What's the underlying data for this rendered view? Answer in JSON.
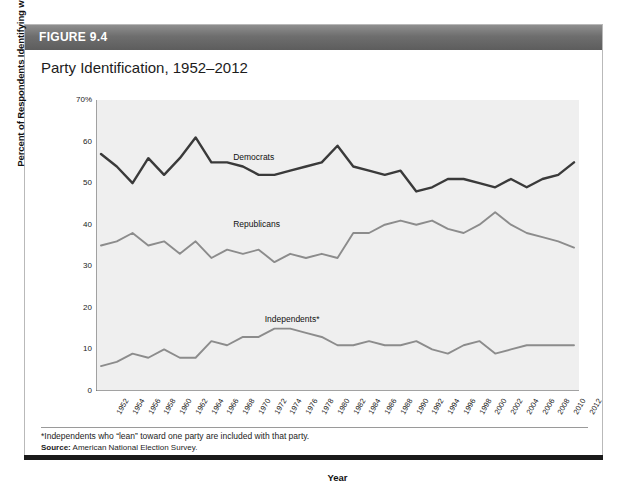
{
  "figure": {
    "header_label": "FIGURE 9.4",
    "title": "Party Identification, 1952–2012",
    "footnote": "*Independents who “lean” toward one party are included with that party.",
    "source_label": "Source:",
    "source_text": "American National Election Survey."
  },
  "colors": {
    "header_bar": "#6e6e6e",
    "plot_background": "#efefef",
    "democrats": "#3a3a3a",
    "republicans": "#8c8c8c",
    "independents": "#8c8c8c",
    "axis": "#555555",
    "bottom_rule": "#1a1a1a"
  },
  "chart_data": {
    "type": "line",
    "title": "Party Identification, 1952–2012",
    "xlabel": "Year",
    "ylabel": "Percent of Respondents Identifying with Party",
    "ylim": [
      0,
      70
    ],
    "yticks": [
      0,
      10,
      20,
      30,
      40,
      50,
      60,
      70
    ],
    "ytick_labels": [
      "0",
      "10",
      "20",
      "30",
      "40",
      "50",
      "60",
      "70%"
    ],
    "grid": false,
    "legend_position": "inline-labels",
    "x": [
      1952,
      1954,
      1956,
      1958,
      1960,
      1962,
      1964,
      1966,
      1968,
      1970,
      1972,
      1974,
      1976,
      1978,
      1980,
      1982,
      1984,
      1986,
      1988,
      1990,
      1992,
      1994,
      1996,
      1998,
      2000,
      2002,
      2004,
      2006,
      2008,
      2010,
      2012
    ],
    "xtick_labels": [
      "1952",
      "1954",
      "1956",
      "1958",
      "1960",
      "1962",
      "1964",
      "1966",
      "1968",
      "1970",
      "1972",
      "1974",
      "1976",
      "1978",
      "1980",
      "1982",
      "1984",
      "1986",
      "1988",
      "1990",
      "1992",
      "1994",
      "1996",
      "1998",
      "2000",
      "2002",
      "2004",
      "2006",
      "2008",
      "2010",
      "2012"
    ],
    "series": [
      {
        "name": "Democrats",
        "color": "#3a3a3a",
        "label_x": 1968,
        "label_y": 56,
        "values": [
          57,
          54,
          50,
          56,
          52,
          56,
          61,
          55,
          55,
          54,
          52,
          52,
          53,
          54,
          55,
          59,
          54,
          53,
          52,
          53,
          48,
          49,
          51,
          51,
          50,
          49,
          51,
          49,
          51,
          52,
          55
        ]
      },
      {
        "name": "Republicans",
        "color": "#8c8c8c",
        "label_x": 1968,
        "label_y": 40,
        "values": [
          35,
          36,
          38,
          35,
          36,
          33,
          36,
          32,
          34,
          33,
          34,
          31,
          33,
          32,
          33,
          32,
          38,
          38,
          40,
          41,
          40,
          41,
          39,
          38,
          40,
          43,
          40,
          38,
          37,
          36,
          34.5
        ]
      },
      {
        "name": "Independents*",
        "color": "#8c8c8c",
        "label_x": 1972,
        "label_y": 17,
        "values": [
          6,
          7,
          9,
          8,
          10,
          8,
          8,
          12,
          11,
          13,
          13,
          15,
          15,
          14,
          13,
          11,
          11,
          12,
          11,
          11,
          12,
          10,
          9,
          11,
          12,
          9,
          10,
          11,
          11,
          11,
          11
        ]
      }
    ]
  }
}
